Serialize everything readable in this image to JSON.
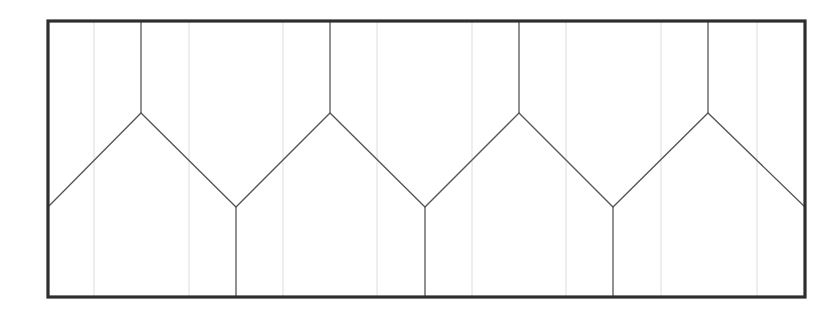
{
  "document": {
    "title": "Zigzag Panel Elevation Drawing",
    "background_color": "#ffffff",
    "width": 840,
    "height": 315
  },
  "drawing": {
    "type": "line-drawing",
    "description": "Rectangular frame subdivided by a continuous zigzag chevron line with vertical stiffeners rising from each peak and descending from each valley.",
    "frame": {
      "name": "outer-rectangle",
      "x": 48,
      "y": 21,
      "width": 757,
      "height": 276,
      "stroke_color": "#2e2e2e",
      "stroke_width": 3.2
    },
    "styles": {
      "primary_stroke_color": "#555555",
      "primary_stroke_width": 1.3,
      "faint_stroke_color": "#dcdcdc",
      "faint_stroke_width": 1.0
    },
    "geometry": {
      "peak_y": 113,
      "valley_y": 207,
      "top_y": 21,
      "bottom_y": 297,
      "left_x": 48,
      "right_x": 805,
      "peak_x": [
        141,
        330,
        519,
        708
      ],
      "valley_x": [
        236,
        425,
        613
      ],
      "edge_valley_x": [
        48,
        805
      ],
      "faint_line_x": [
        94,
        189,
        283,
        377,
        472,
        566,
        661,
        757
      ],
      "module_pitch": 189,
      "half_pitch": 94.5,
      "module_count": 4
    },
    "zigzag_path": "M 48,207 L 141,113 L 236,207 L 330,113 L 425,207 L 519,113 L 613,207 L 708,113 L 805,207",
    "peak_stems": [
      {
        "name": "peak-stem-1",
        "x": 141,
        "y1": 21,
        "y2": 113
      },
      {
        "name": "peak-stem-2",
        "x": 330,
        "y1": 21,
        "y2": 113
      },
      {
        "name": "peak-stem-3",
        "x": 519,
        "y1": 21,
        "y2": 113
      },
      {
        "name": "peak-stem-4",
        "x": 708,
        "y1": 21,
        "y2": 113
      }
    ],
    "valley_stems": [
      {
        "name": "valley-stem-1",
        "x": 236,
        "y1": 207,
        "y2": 297
      },
      {
        "name": "valley-stem-2",
        "x": 425,
        "y1": 207,
        "y2": 297
      },
      {
        "name": "valley-stem-3",
        "x": 613,
        "y1": 207,
        "y2": 297
      }
    ],
    "faint_verticals": [
      {
        "name": "faint-vertical-1",
        "x": 94,
        "y1": 21,
        "y2": 297
      },
      {
        "name": "faint-vertical-2",
        "x": 189,
        "y1": 21,
        "y2": 297
      },
      {
        "name": "faint-vertical-3",
        "x": 283,
        "y1": 21,
        "y2": 297
      },
      {
        "name": "faint-vertical-4",
        "x": 377,
        "y1": 21,
        "y2": 297
      },
      {
        "name": "faint-vertical-5",
        "x": 472,
        "y1": 21,
        "y2": 297
      },
      {
        "name": "faint-vertical-6",
        "x": 566,
        "y1": 21,
        "y2": 297
      },
      {
        "name": "faint-vertical-7",
        "x": 661,
        "y1": 21,
        "y2": 297
      },
      {
        "name": "faint-vertical-8",
        "x": 757,
        "y1": 21,
        "y2": 297
      }
    ]
  }
}
